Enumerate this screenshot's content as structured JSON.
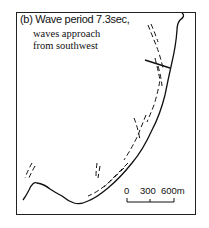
{
  "figure": {
    "title": "(b) Wave period 7.3sec,",
    "subtitle_line1": "waves approach",
    "subtitle_line2": "from southwest"
  },
  "scale_bar": {
    "labels": [
      "0",
      "300",
      "600m"
    ]
  },
  "colors": {
    "ink": "#111111",
    "background": "#ffffff"
  }
}
